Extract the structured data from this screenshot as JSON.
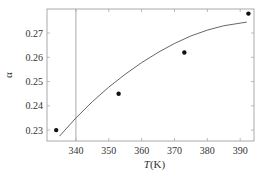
{
  "chart_data": {
    "type": "scatter",
    "title": "",
    "xlabel_italic": "T",
    "xlabel_unit": "(K)",
    "ylabel": "α",
    "xlim": [
      331.2,
      394.2
    ],
    "ylim": [
      0.2255,
      0.2799
    ],
    "x_ticks": [
      340,
      350,
      360,
      370,
      380,
      390
    ],
    "x_tick_labels": [
      "340",
      "350",
      "360",
      "370",
      "380",
      "390"
    ],
    "y_ticks": [
      0.23,
      0.24,
      0.25,
      0.26,
      0.27
    ],
    "y_tick_labels": [
      "0.23",
      "0.24",
      "0.25",
      "0.26",
      "0.27"
    ],
    "grid": false,
    "reference_line_x": 340,
    "series": [
      {
        "name": "measured",
        "kind": "points",
        "x": [
          334,
          353,
          373,
          392.5
        ],
        "y": [
          0.23,
          0.245,
          0.262,
          0.278
        ]
      },
      {
        "name": "fit",
        "kind": "line",
        "x": [
          335,
          340,
          345,
          350,
          355,
          360,
          365,
          370,
          375,
          380,
          385,
          392
        ],
        "y": [
          0.2275,
          0.235,
          0.2417,
          0.2477,
          0.253,
          0.2578,
          0.262,
          0.2657,
          0.2688,
          0.2712,
          0.273,
          0.2745
        ]
      }
    ]
  }
}
